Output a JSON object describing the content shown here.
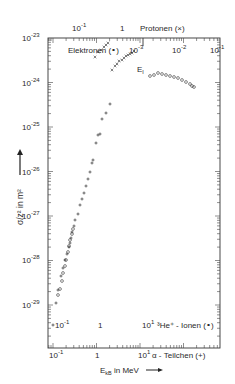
{
  "chart_data": {
    "type": "scatter",
    "title": "",
    "ylabel": "σ/z² in m²",
    "xlabel": "E_kB in MeV",
    "y_axis": {
      "scale": "log",
      "ylim": [
        3e-30,
        1e-23
      ],
      "tick_labels": [
        "10^-23",
        "10^-24",
        "10^-25",
        "10^-26",
        "10^-27",
        "10^-28",
        "10^-29"
      ]
    },
    "x_axes": [
      {
        "name": "alpha",
        "position": "bottom",
        "label": "α - Teilchen (+)",
        "tick_labels": [
          "10^-1",
          "1",
          "10^1"
        ]
      },
      {
        "name": "he3",
        "position": "bottom-inner",
        "label": "³He⁺ - Ionen (∘)",
        "tick_labels": [
          "10^-1",
          "1",
          "10^1"
        ]
      },
      {
        "name": "protons",
        "position": "top",
        "label": "Protonen (×)",
        "tick_labels": [
          "10^-1",
          "1"
        ]
      },
      {
        "name": "electrons",
        "position": "top-inner",
        "label": "Elektronen (∘)",
        "tick_labels": [
          "10^-3",
          "10^-2",
          "10^-1"
        ]
      }
    ],
    "annotations": [
      "E_I"
    ],
    "series": [
      {
        "name": "Elektronen (∘)",
        "marker": "circle",
        "points_px": [
          [
            150,
            76
          ],
          [
            154,
            75
          ],
          [
            158,
            73
          ],
          [
            162,
            74
          ],
          [
            166,
            75
          ],
          [
            170,
            76
          ],
          [
            174,
            77
          ],
          [
            178,
            78
          ],
          [
            182,
            80
          ],
          [
            186,
            82
          ],
          [
            190,
            84
          ],
          [
            192,
            86
          ],
          [
            194,
            87
          ]
        ]
      },
      {
        "name": "Protonen (×)",
        "marker": "cross",
        "points_px": [
          [
            95,
            57
          ],
          [
            98,
            52
          ],
          [
            101,
            50
          ],
          [
            104,
            47
          ],
          [
            106,
            45
          ],
          [
            108,
            43
          ],
          [
            112,
            70
          ],
          [
            115,
            66
          ],
          [
            117,
            64
          ],
          [
            119,
            61
          ],
          [
            122,
            60
          ],
          [
            124,
            58
          ],
          [
            126,
            56
          ],
          [
            128,
            55
          ],
          [
            130,
            54
          ],
          [
            132,
            53
          ],
          [
            134,
            51
          ]
        ]
      },
      {
        "name": "³He⁺ - Ionen (∘)",
        "marker": "circle",
        "points_px": [
          [
            58,
            295
          ],
          [
            60,
            289
          ],
          [
            62,
            281
          ],
          [
            63,
            273
          ],
          [
            65,
            266
          ],
          [
            66,
            260
          ],
          [
            68,
            252
          ],
          [
            69,
            246
          ],
          [
            70,
            240
          ],
          [
            72,
            234
          ],
          [
            73,
            229
          ]
        ]
      },
      {
        "name": "α - Teilchen (+)",
        "marker": "plus",
        "points_px": [
          [
            53,
            325
          ],
          [
            56,
            303
          ],
          [
            58,
            290
          ],
          [
            61,
            276
          ],
          [
            63,
            268
          ],
          [
            65,
            260
          ],
          [
            67,
            254
          ],
          [
            69,
            247
          ],
          [
            70,
            243
          ],
          [
            71,
            238
          ],
          [
            72,
            232
          ],
          [
            74,
            226
          ],
          [
            75,
            220
          ],
          [
            78,
            214
          ],
          [
            80,
            205
          ],
          [
            82,
            199
          ],
          [
            84,
            193
          ],
          [
            86,
            186
          ],
          [
            88,
            179
          ],
          [
            90,
            172
          ],
          [
            92,
            163
          ],
          [
            93,
            160
          ],
          [
            96,
            143
          ],
          [
            98,
            135
          ],
          [
            100,
            134
          ],
          [
            102,
            119
          ],
          [
            106,
            113
          ],
          [
            110,
            104
          ]
        ]
      }
    ],
    "legend": {
      "position": "inline-with-axes"
    },
    "grid": false
  },
  "labels": {
    "y_ticks": [
      "-23",
      "-24",
      "-25",
      "-26",
      "-27",
      "-28",
      "-29"
    ],
    "y_base": "10",
    "ylabel": "σ/z² in m²",
    "protons_ticks": [
      "10",
      "1"
    ],
    "protons_exp": "-1",
    "protons_label": "Protonen (×)",
    "electrons_label": "Elektronen (∘)",
    "electrons_ticks_exp": [
      "-3",
      "-2",
      "-1"
    ],
    "ei": "E",
    "ei_sub": "I",
    "he_label": "³He⁺ - Ionen (∘)",
    "he_ticks": [
      "10",
      "1",
      "10"
    ],
    "alpha_label": "α - Teilchen (+)",
    "alpha_ticks": [
      "10",
      "1",
      "10"
    ],
    "xlabel": "E",
    "xlabel_sub": "kB",
    "xlabel_unit": " in MeV"
  }
}
